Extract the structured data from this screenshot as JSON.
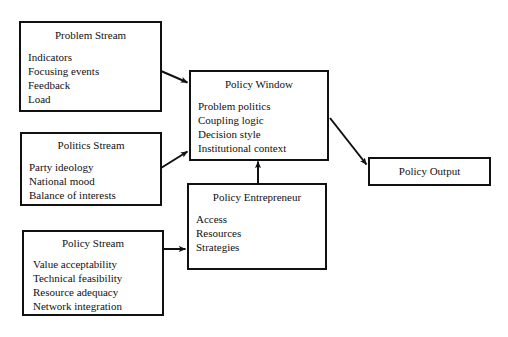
{
  "diagram": {
    "background_color": "#ffffff",
    "line_color": "#111111",
    "text_color": "#111111",
    "nodes": [
      {
        "id": "problem-stream",
        "title": "Problem Stream",
        "items": [
          "Indicators",
          "Focusing events",
          "Feedback",
          "Load"
        ]
      },
      {
        "id": "politics-stream",
        "title": "Politics Stream",
        "items": [
          "Party ideology",
          "National mood",
          "Balance of interests"
        ]
      },
      {
        "id": "policy-stream",
        "title": "Policy Stream",
        "items": [
          "Value acceptability",
          "Technical feasibility",
          "Resource adequacy",
          "Network integration"
        ]
      },
      {
        "id": "policy-window",
        "title": "Policy Window",
        "items": [
          "Problem politics",
          "Coupling logic",
          "Decision style",
          "Institutional context"
        ]
      },
      {
        "id": "policy-entrepreneur",
        "title": "Policy Entrepreneur",
        "items": [
          "Access",
          "Resources",
          "Strategies"
        ]
      },
      {
        "id": "policy-output",
        "title": "Policy Output",
        "items": []
      }
    ],
    "edges": [
      {
        "id": "problem-to-window",
        "from": "problem-stream",
        "to": "policy-window",
        "style": "diagonal-down"
      },
      {
        "id": "politics-to-window",
        "from": "politics-stream",
        "to": "policy-window",
        "style": "diagonal-up"
      },
      {
        "id": "policy-to-entrepreneur",
        "from": "policy-stream",
        "to": "policy-entrepreneur",
        "style": "horizontal"
      },
      {
        "id": "entrepreneur-to-window",
        "from": "policy-entrepreneur",
        "to": "policy-window",
        "style": "vertical-up"
      },
      {
        "id": "window-to-output",
        "from": "policy-window",
        "to": "policy-output",
        "style": "diagonal-down"
      }
    ]
  }
}
